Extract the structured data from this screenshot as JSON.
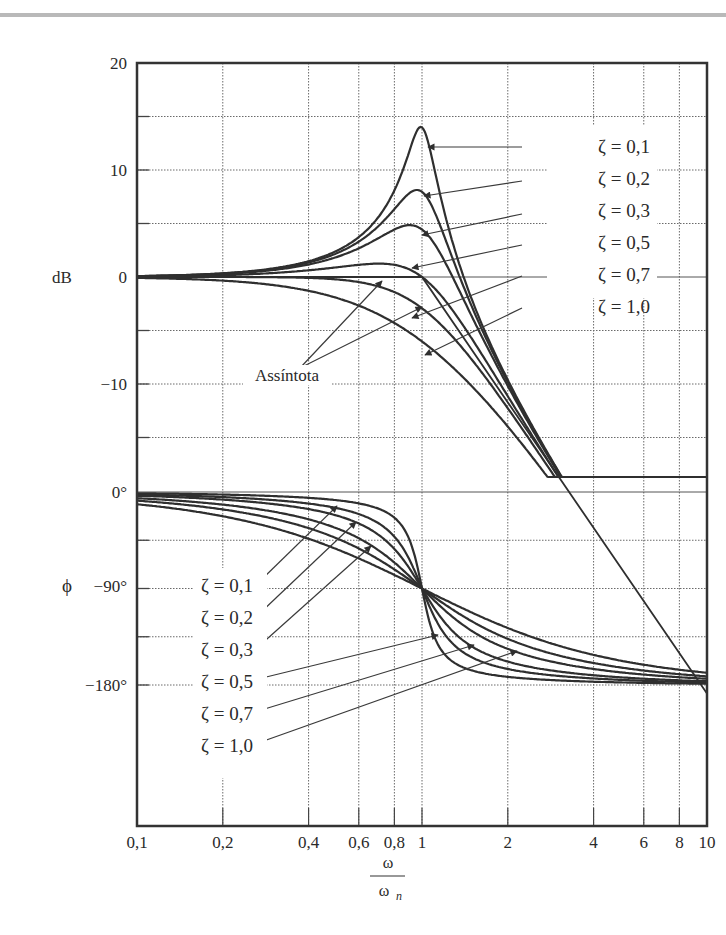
{
  "chart_data": {
    "type": "line",
    "title": "",
    "xscale": "log",
    "xlim": [
      0.1,
      10
    ],
    "x_ticks": [
      0.1,
      0.2,
      0.4,
      0.6,
      0.8,
      1,
      2,
      4,
      6,
      8,
      10
    ],
    "x_tick_labels": [
      "0,1",
      "0,2",
      "0,4",
      "0,6",
      "0,8",
      "1",
      "2",
      "4",
      "6",
      "8",
      "10"
    ],
    "xlabel_numerator": "ω",
    "xlabel_denominator": "ω",
    "xlabel_subscript": "n",
    "grid": true,
    "panels": [
      {
        "name": "magnitude",
        "ylabel": "dB",
        "ylim": [
          -20,
          20
        ],
        "y_ticks": [
          20,
          10,
          0,
          -10
        ],
        "y_tick_labels": [
          "20",
          "10",
          "0",
          "−10"
        ],
        "series": [
          {
            "name": "ζ = 0,1",
            "zeta": 0.1,
            "peak_db": 14.0
          },
          {
            "name": "ζ = 0,2",
            "zeta": 0.2,
            "peak_db": 8.1
          },
          {
            "name": "ζ = 0,3",
            "zeta": 0.3,
            "peak_db": 4.6
          },
          {
            "name": "ζ = 0,5",
            "zeta": 0.5,
            "peak_db": 1.2
          },
          {
            "name": "ζ = 0,7",
            "zeta": 0.7,
            "peak_db": 0.0
          },
          {
            "name": "ζ = 1,0",
            "zeta": 1.0,
            "peak_db": 0.0
          }
        ],
        "asymptote": {
          "label": "Assíntota",
          "description": "0 dB for ω/ωn < 1, −40 dB/decade above"
        }
      },
      {
        "name": "phase",
        "ylabel": "ϕ",
        "ylim": [
          -270,
          0
        ],
        "y_ticks": [
          0,
          -90,
          -180
        ],
        "y_tick_labels": [
          "0°",
          "−90°",
          "−180°"
        ],
        "series": [
          {
            "name": "ζ = 0,1",
            "zeta": 0.1
          },
          {
            "name": "ζ = 0,2",
            "zeta": 0.2
          },
          {
            "name": "ζ = 0,3",
            "zeta": 0.3
          },
          {
            "name": "ζ = 0,5",
            "zeta": 0.5
          },
          {
            "name": "ζ = 0,7",
            "zeta": 0.7
          },
          {
            "name": "ζ = 1,0",
            "zeta": 1.0
          }
        ]
      }
    ]
  },
  "labels": {
    "mag_ylabel": "dB",
    "phase_ylabel": "ϕ",
    "asymptote": "Assíntota",
    "x_num": "ω",
    "x_den": "ω",
    "x_sub": "n",
    "mag_ticks": [
      "20",
      "10",
      "0",
      "−10"
    ],
    "phase_ticks": [
      "0°",
      "−90°",
      "−180°"
    ],
    "zeta_labels": [
      "ζ = 0,1",
      "ζ = 0,2",
      "ζ = 0,3",
      "ζ = 0,5",
      "ζ = 0,7",
      "ζ = 1,0"
    ],
    "x_tick_labels": [
      "0,1",
      "0,2",
      "0,4",
      "0,6",
      "0,8",
      "1",
      "2",
      "4",
      "6",
      "8",
      "10"
    ]
  },
  "colors": {
    "curve": "#2f2f2f",
    "grid": "#6a6a6a",
    "frame": "#333333",
    "topbar": "#b9b9b9"
  }
}
